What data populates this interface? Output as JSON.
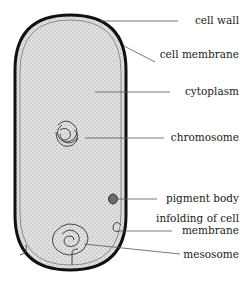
{
  "colors": {
    "outline": "#111111",
    "cytoplasm": "#d8d8d8",
    "pigment": "#6a6a6a",
    "leader": "#555555"
  },
  "labels": {
    "cell_wall": "cell wall",
    "cell_membrane": "cell membrane",
    "cytoplasm": "cytoplasm",
    "chromosome": "chromosome",
    "pigment_body": "pigment body",
    "infolding_line1": "infolding of cell",
    "infolding_line2": "membrane",
    "mesosome": "mesosome"
  }
}
